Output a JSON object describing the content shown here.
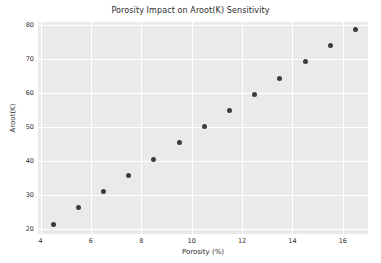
{
  "chart_data": {
    "type": "scatter",
    "title": "Porosity Impact on Aroot(K) Sensitivity",
    "xlabel": "Porosity (%)",
    "ylabel": "Aroot(K)",
    "xlim": [
      3.9,
      17.0
    ],
    "ylim": [
      18.6,
      81.0
    ],
    "xticks": [
      4,
      6,
      8,
      10,
      12,
      14,
      16
    ],
    "xtick_labels": [
      "4",
      "6",
      "8",
      "10",
      "12",
      "14",
      "16"
    ],
    "yticks": [
      20,
      30,
      40,
      50,
      60,
      70,
      80
    ],
    "ytick_labels": [
      "20",
      "30",
      "40",
      "50",
      "60",
      "70",
      "80"
    ],
    "grid": true,
    "legend": "none",
    "marker_color": "#3c3c3c",
    "plot_background": "#eaeaea",
    "figure_background": "#ffffff",
    "grid_color": "#ffffff",
    "series": [
      {
        "name": "Aroot(K) vs Porosity",
        "x": [
          4.5,
          5.5,
          6.5,
          7.5,
          8.5,
          9.5,
          10.5,
          11.5,
          12.5,
          13.5,
          14.5,
          15.5,
          16.5
        ],
        "y": [
          21.5,
          26.3,
          31.2,
          35.7,
          40.6,
          45.6,
          50.2,
          55.0,
          59.8,
          64.5,
          69.3,
          74.0,
          78.8
        ]
      }
    ]
  }
}
